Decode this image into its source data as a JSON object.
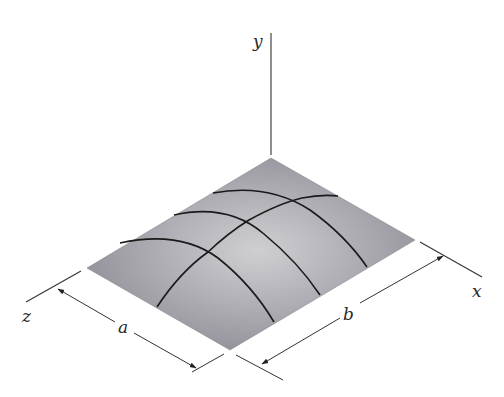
{
  "figure": {
    "type": "isometric-plate-diagram",
    "axes": {
      "x": {
        "label": "x"
      },
      "y": {
        "label": "y"
      },
      "z": {
        "label": "z"
      }
    },
    "dimensions": {
      "a": {
        "label": "a",
        "along": "z"
      },
      "b": {
        "label": "b",
        "along": "x"
      }
    },
    "plate": {
      "corners": {
        "back": [
          271,
          158
        ],
        "left": [
          87,
          268
        ],
        "front": [
          230,
          350
        ],
        "right": [
          415,
          240
        ]
      },
      "fill_highlight": "#cfcfd3",
      "fill_edge": "#8c8a92",
      "grid_color": "#1a1a1a",
      "grid_lines_x_direction": 3,
      "grid_lines_z_direction": 1
    }
  }
}
